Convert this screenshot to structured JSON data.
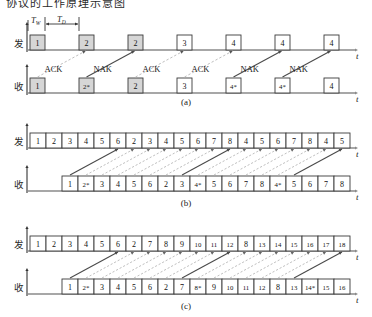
{
  "figure": {
    "clipped_header_text": "协议的工作原理示意图",
    "axis_label": "t",
    "sender_label": "发",
    "receiver_label": "收",
    "timing": {
      "tw": "T",
      "tw_sub": "W",
      "td": "T",
      "td_sub": "D"
    }
  },
  "panels": [
    {
      "id": "a",
      "caption": "(a)",
      "sender_frames": [
        {
          "label": "1",
          "shaded": true
        },
        {
          "label": "2",
          "shaded": true
        },
        {
          "label": "2",
          "shaded": true
        },
        {
          "label": "3",
          "shaded": false
        },
        {
          "label": "4",
          "shaded": false
        },
        {
          "label": "4",
          "shaded": false
        },
        {
          "label": "4",
          "shaded": false
        }
      ],
      "receiver_frames": [
        {
          "label": "1",
          "shaded": true
        },
        {
          "label": "2*",
          "shaded": true
        },
        {
          "label": "2",
          "shaded": true
        },
        {
          "label": "3",
          "shaded": false
        },
        {
          "label": "4*",
          "shaded": false
        },
        {
          "label": "4*",
          "shaded": false
        },
        {
          "label": "4",
          "shaded": false
        }
      ],
      "responses": [
        "ACK",
        "NAK",
        "ACK",
        "ACK",
        "NAK",
        "NAK"
      ],
      "response_kinds": [
        "ack",
        "nak",
        "ack",
        "ack",
        "nak",
        "nak"
      ]
    },
    {
      "id": "b",
      "caption": "(b)",
      "sender_frames": [
        "1",
        "2",
        "3",
        "4",
        "5",
        "6",
        "2",
        "3",
        "4",
        "5",
        "6",
        "7",
        "8",
        "4",
        "5",
        "6",
        "7",
        "8",
        "4",
        "5"
      ],
      "receiver_frames": [
        "1",
        "2*",
        "3",
        "4",
        "5",
        "6",
        "2",
        "3",
        "4*",
        "5",
        "6",
        "7",
        "8",
        "4*",
        "5",
        "6",
        "7",
        "8"
      ],
      "arrow_kinds": [
        "nak",
        "ack",
        "ack",
        "ack",
        "ack",
        "ack",
        "ack",
        "nak",
        "ack",
        "ack",
        "ack",
        "ack",
        "ack",
        "ack",
        "nak",
        "ack"
      ]
    },
    {
      "id": "c",
      "caption": "(c)",
      "sender_frames": [
        "1",
        "2",
        "3",
        "4",
        "5",
        "6",
        "2",
        "7",
        "8",
        "9",
        "10",
        "11",
        "12",
        "8",
        "13",
        "14",
        "15",
        "16",
        "17",
        "18"
      ],
      "receiver_frames": [
        "1",
        "2*",
        "3",
        "4",
        "5",
        "6",
        "2",
        "7",
        "8*",
        "9",
        "10",
        "11",
        "12",
        "8",
        "13",
        "14*",
        "15",
        "16"
      ],
      "arrow_kinds": [
        "nak",
        "ack",
        "ack",
        "ack",
        "ack",
        "ack",
        "ack",
        "nak",
        "ack",
        "ack",
        "ack",
        "ack",
        "ack",
        "ack",
        "nak",
        "ack"
      ]
    }
  ],
  "colors": {
    "shaded_fill": "#d6d6d6",
    "plain_fill": "#ffffff",
    "stroke": "#3a3a3a",
    "axis": "#8a8a8a",
    "nak_line": "#4a4a4a",
    "ack_line": "#b5b5b5"
  }
}
